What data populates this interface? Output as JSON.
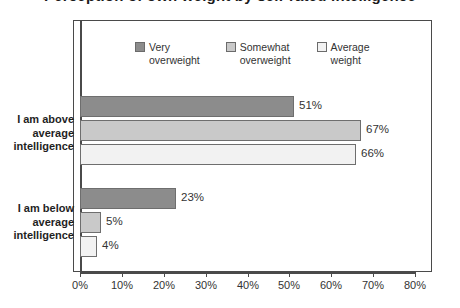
{
  "chart_data": {
    "type": "bar",
    "orientation": "horizontal",
    "title": "Perception of own weight by self-rated intelligence",
    "xlabel": "",
    "ylabel": "",
    "xlim": [
      0,
      80
    ],
    "xticks": [
      "0%",
      "10%",
      "20%",
      "30%",
      "40%",
      "50%",
      "60%",
      "70%",
      "80%"
    ],
    "grid": false,
    "legend_position": "top-inside",
    "categories": [
      "I am above\naverage\nintelligence",
      "I am below\naverage\nintelligence"
    ],
    "series": [
      {
        "name": "Very\noverweight",
        "color": "#8c8c8c",
        "values": [
          51,
          23
        ],
        "labels": [
          "51%",
          "23%"
        ]
      },
      {
        "name": "Somewhat\noverweight",
        "color": "#c9c9c9",
        "values": [
          67,
          5
        ],
        "labels": [
          "67%",
          "5%"
        ]
      },
      {
        "name": "Average\nweight",
        "color": "#f2f2f2",
        "values": [
          66,
          4
        ],
        "labels": [
          "66%",
          "4%"
        ]
      }
    ]
  },
  "legend": {
    "items": [
      {
        "label": "Very\noverweight"
      },
      {
        "label": "Somewhat\noverweight"
      },
      {
        "label": "Average\nweight"
      }
    ]
  },
  "axis": {
    "ticks": [
      {
        "label": "0%"
      },
      {
        "label": "10%"
      },
      {
        "label": "20%"
      },
      {
        "label": "30%"
      },
      {
        "label": "40%"
      },
      {
        "label": "50%"
      },
      {
        "label": "60%"
      },
      {
        "label": "70%"
      },
      {
        "label": "80%"
      }
    ]
  },
  "groups": [
    {
      "label": "I am above\naverage\nintelligence",
      "bars": [
        {
          "value": 51,
          "label": "51%",
          "color": "#8c8c8c"
        },
        {
          "value": 67,
          "label": "67%",
          "color": "#c9c9c9"
        },
        {
          "value": 66,
          "label": "66%",
          "color": "#f2f2f2"
        }
      ]
    },
    {
      "label": "I am below\naverage\nintelligence",
      "bars": [
        {
          "value": 23,
          "label": "23%",
          "color": "#8c8c8c"
        },
        {
          "value": 5,
          "label": "5%",
          "color": "#c9c9c9"
        },
        {
          "value": 4,
          "label": "4%",
          "color": "#f2f2f2"
        }
      ]
    }
  ],
  "colors": {
    "very_overweight": "#8c8c8c",
    "somewhat_overweight": "#c9c9c9",
    "average_weight": "#f2f2f2",
    "frame": "#4a4a4a",
    "text": "#2a2a2a"
  }
}
